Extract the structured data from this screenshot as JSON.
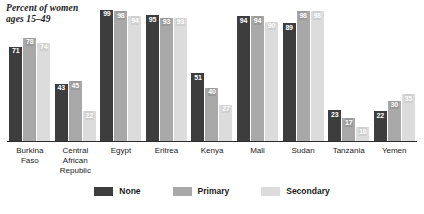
{
  "chart_data": {
    "type": "bar",
    "title": "Percent of women\nages 15–49",
    "xlabel": "",
    "ylabel": "",
    "ylim": [
      0,
      100
    ],
    "grid": false,
    "legend_position": "bottom",
    "categories": [
      "Burkina\nFaso",
      "Central\nAfrican\nRepublic",
      "Egypt",
      "Eritrea",
      "Kenya",
      "Mali",
      "Sudan",
      "Tanzania",
      "Yemen"
    ],
    "series": [
      {
        "name": "None",
        "color": "#3d3d3d",
        "values": [
          71,
          43,
          99,
          95,
          51,
          94,
          89,
          23,
          22
        ]
      },
      {
        "name": "Primary",
        "color": "#a8a8a8",
        "values": [
          78,
          45,
          98,
          93,
          40,
          94,
          98,
          17,
          30
        ]
      },
      {
        "name": "Secondary",
        "color": "#dcdcdc",
        "values": [
          74,
          22,
          94,
          93,
          27,
          90,
          98,
          10,
          35
        ]
      }
    ]
  },
  "legend": {
    "items": [
      {
        "label": "None",
        "key": "none"
      },
      {
        "label": "Primary",
        "key": "primary"
      },
      {
        "label": "Secondary",
        "key": "secondary"
      }
    ]
  }
}
